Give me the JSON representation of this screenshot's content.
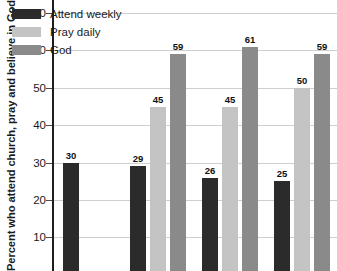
{
  "chart_data": {
    "type": "bar",
    "title": "",
    "xlabel": "",
    "ylabel": "Percent who attend church, pray and believe in God",
    "ylim": [
      0,
      73
    ],
    "yticks": [
      70,
      60,
      50,
      40,
      30,
      20,
      10
    ],
    "ytick_labels": [
      "70",
      "60",
      "50",
      "40",
      "30",
      "20",
      "10"
    ],
    "grid": true,
    "legend_position": "top-left",
    "categories": [
      "",
      "",
      "",
      ""
    ],
    "series": [
      {
        "name": "Attend weekly",
        "color": "#2b2b2b",
        "values": [
          30,
          29,
          26,
          25
        ],
        "labels": [
          "30",
          "29",
          "26",
          "25"
        ]
      },
      {
        "name": "Pray daily",
        "color": "#c4c4c4",
        "values": [
          null,
          45,
          45,
          50
        ],
        "labels": [
          "",
          "45",
          "45",
          "50"
        ]
      },
      {
        "name": "God",
        "color": "#8a8a8a",
        "values": [
          null,
          59,
          61,
          59
        ],
        "labels": [
          "",
          "59",
          "61",
          "59"
        ]
      }
    ]
  },
  "legend": {
    "items": [
      {
        "label": "Attend weekly",
        "color": "#2b2b2b"
      },
      {
        "label": "Pray daily",
        "color": "#c4c4c4"
      },
      {
        "label": "God",
        "color": "#8a8a8a"
      }
    ]
  },
  "axis": {
    "y_title": "Percent who attend church, pray and believe in God",
    "y_tick_labels": [
      "70",
      "60",
      "50",
      "40",
      "30",
      "20",
      "10"
    ]
  },
  "colors": {
    "attend_weekly": "#2b2b2b",
    "pray_daily": "#c4c4c4",
    "god": "#8a8a8a",
    "gridline": "#cfcfcf",
    "axis": "#1d1d1d",
    "text": "#1a1a1a",
    "background": "#ffffff"
  }
}
